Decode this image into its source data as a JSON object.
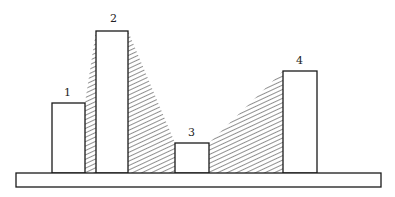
{
  "diagram": {
    "type": "bar-silhouette",
    "labels": {
      "b1": "1",
      "b2": "2",
      "b3": "3",
      "b4": "4"
    },
    "colors": {
      "stroke": "#1a1a1a",
      "fill": "#ffffff",
      "hatch": "#222222"
    }
  }
}
